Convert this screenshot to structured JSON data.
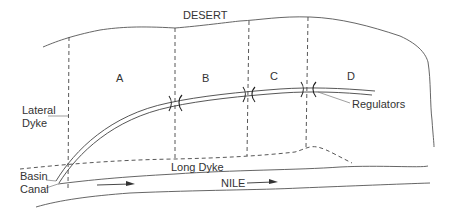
{
  "diagram": {
    "labels": {
      "desert": "DESERT",
      "basin_a": "A",
      "basin_b": "B",
      "basin_c": "C",
      "basin_d": "D",
      "lateral_dyke_line1": "Lateral",
      "lateral_dyke_line2": "Dyke",
      "regulators": "Regulators",
      "basin_canal_line1": "Basin",
      "basin_canal_line2": "Canal",
      "long_dyke": "Long Dyke",
      "nile": "NILE"
    },
    "colors": {
      "background": "#ffffff",
      "ink": "#333333"
    }
  }
}
